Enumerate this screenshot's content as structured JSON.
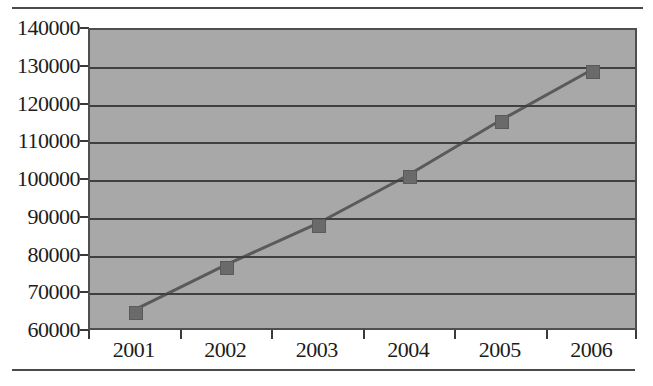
{
  "chart_data": {
    "type": "line",
    "title": "",
    "xlabel": "",
    "ylabel": "",
    "categories": [
      "2001",
      "2002",
      "2003",
      "2004",
      "2005",
      "2006"
    ],
    "values": [
      65000,
      77000,
      88000,
      101000,
      115500,
      129000
    ],
    "series": [
      {
        "name": "Series 1",
        "values": [
          65000,
          77000,
          88000,
          101000,
          115500,
          129000
        ]
      }
    ],
    "ylim": [
      60000,
      140000
    ],
    "ytick_interval": 10000,
    "ytick_labels": [
      "140000",
      "130000",
      "120000",
      "110000",
      "100000",
      "90000",
      "80000",
      "70000",
      "60000"
    ],
    "ytick_values": [
      140000,
      130000,
      120000,
      110000,
      100000,
      90000,
      80000,
      70000,
      60000
    ],
    "grid": true,
    "grid_axis": "y",
    "legend": false,
    "legend_position": "none",
    "marker": "square",
    "colors": {
      "plot_background": "#a8a8a8",
      "line": "#5a5a5a",
      "marker": "#6a6a6a",
      "gridline": "#404040",
      "axis": "#4f4f4f",
      "text": "#1c1c1c",
      "page_rule": "#4a4a4a"
    }
  }
}
